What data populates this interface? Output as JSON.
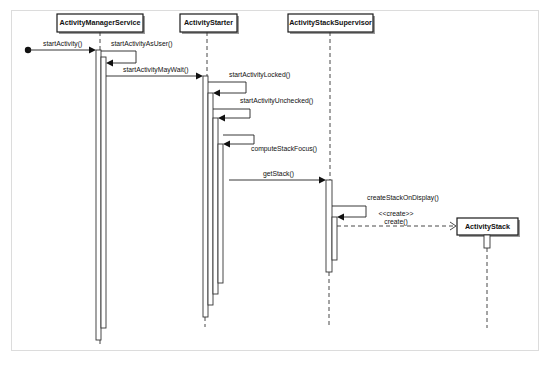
{
  "diagram": {
    "type": "UML sequence diagram",
    "lifelines": [
      {
        "id": "ams",
        "label": "ActivityManagerService"
      },
      {
        "id": "as",
        "label": "ActivityStarter"
      },
      {
        "id": "ass",
        "label": "ActivityStackSupervisor"
      },
      {
        "id": "stk",
        "label": "ActivityStack"
      }
    ],
    "messages": [
      {
        "from": "external",
        "to": "ActivityManagerService",
        "label": "startActivity()",
        "kind": "call"
      },
      {
        "from": "ActivityManagerService",
        "to": "ActivityManagerService",
        "label": "startActivityAsUser()",
        "kind": "self-call"
      },
      {
        "from": "ActivityManagerService",
        "to": "ActivityStarter",
        "label": "startActivityMayWait()",
        "kind": "call"
      },
      {
        "from": "ActivityStarter",
        "to": "ActivityStarter",
        "label": "startActivityLocked()",
        "kind": "self-call"
      },
      {
        "from": "ActivityStarter",
        "to": "ActivityStarter",
        "label": "startActivityUnchecked()",
        "kind": "self-call"
      },
      {
        "from": "ActivityStarter",
        "to": "ActivityStarter",
        "label": "computeStackFocus()",
        "kind": "self-call"
      },
      {
        "from": "ActivityStarter",
        "to": "ActivityStackSupervisor",
        "label": "getStack()",
        "kind": "call"
      },
      {
        "from": "ActivityStackSupervisor",
        "to": "ActivityStackSupervisor",
        "label": "createStackOnDisplay()",
        "kind": "self-call"
      },
      {
        "from": "ActivityStackSupervisor",
        "to": "ActivityStack",
        "stereotype": "<<create>>",
        "label": "create()",
        "kind": "create"
      }
    ],
    "colors": {
      "stroke": "#1a1a1a",
      "frame": "#b8b8b8",
      "background": "#ffffff"
    }
  }
}
